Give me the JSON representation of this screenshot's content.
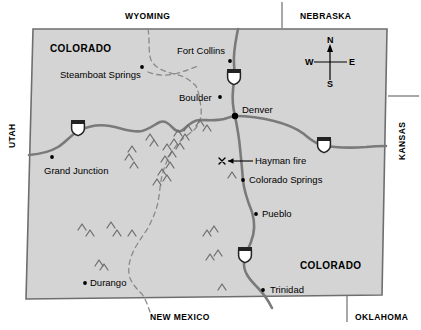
{
  "map": {
    "title": "Colorado state map showing the Hayman fire location",
    "fill_color": "#d4d4d4",
    "outline_color": "#6e6e6e",
    "road_color": "#7a7a7a",
    "border_dash_color": "#8a8a8a"
  },
  "neighbors": [
    {
      "name": "wyoming",
      "label": "WYOMING",
      "x": 125,
      "y": 12
    },
    {
      "name": "nebraska",
      "label": "NEBRASKA",
      "x": 300,
      "y": 12
    },
    {
      "name": "utah",
      "label": "UTAH",
      "x": 8,
      "y": 148,
      "rotated": "left"
    },
    {
      "name": "kansas",
      "label": "KANSAS",
      "x": 398,
      "y": 160,
      "rotated": "left"
    },
    {
      "name": "new-mexico",
      "label": "NEW MEXICO",
      "x": 150,
      "y": 313
    },
    {
      "name": "oklahoma",
      "label": "OKLAHOMA",
      "x": 355,
      "y": 313
    }
  ],
  "state_labels": [
    {
      "name": "colorado-northwest",
      "label": "COLORADO",
      "x": 50,
      "y": 44
    },
    {
      "name": "colorado-southeast",
      "label": "COLORADO",
      "x": 300,
      "y": 261
    }
  ],
  "cities": [
    {
      "name": "steamboat-springs",
      "label": "Steamboat Springs",
      "dot_x": 142,
      "dot_y": 67,
      "label_x": 60,
      "label_y": 70,
      "anchor": "left"
    },
    {
      "name": "fort-collins",
      "label": "Fort Collins",
      "dot_x": 230,
      "dot_y": 61,
      "label_x": 177,
      "label_y": 46,
      "anchor": "left"
    },
    {
      "name": "boulder",
      "label": "Boulder",
      "dot_x": 220,
      "dot_y": 97,
      "label_x": 179,
      "label_y": 93,
      "anchor": "left"
    },
    {
      "name": "denver",
      "label": "Denver",
      "dot_x": 235,
      "dot_y": 116,
      "label_x": 242,
      "label_y": 105,
      "anchor": "left"
    },
    {
      "name": "grand-junction",
      "label": "Grand Junction",
      "dot_x": 52,
      "dot_y": 157,
      "label_x": 44,
      "label_y": 166,
      "anchor": "left"
    },
    {
      "name": "colorado-springs",
      "label": "Colorado Springs",
      "dot_x": 243,
      "dot_y": 180,
      "label_x": 249,
      "label_y": 175,
      "anchor": "left"
    },
    {
      "name": "pueblo",
      "label": "Pueblo",
      "dot_x": 256,
      "dot_y": 214,
      "label_x": 262,
      "label_y": 209,
      "anchor": "left"
    },
    {
      "name": "trinidad",
      "label": "Trinidad",
      "dot_x": 263,
      "dot_y": 290,
      "label_x": 270,
      "label_y": 285,
      "anchor": "left"
    },
    {
      "name": "durango",
      "label": "Durango",
      "dot_x": 85,
      "dot_y": 283,
      "label_x": 90,
      "label_y": 278,
      "anchor": "left"
    }
  ],
  "annotations": [
    {
      "name": "hayman-fire",
      "label": "Hayman fire",
      "marker": "x",
      "marker_x": 222,
      "marker_y": 161,
      "arrow_from_x": 253,
      "arrow_to_x": 228,
      "arrow_y": 161,
      "label_x": 255,
      "label_y": 156
    }
  ],
  "highways": [
    {
      "name": "i-70-west",
      "number": "70",
      "x": 78,
      "y": 128
    },
    {
      "name": "i-70-east",
      "number": "70",
      "x": 324,
      "y": 145
    },
    {
      "name": "i-25-north",
      "number": "25",
      "x": 234,
      "y": 77
    },
    {
      "name": "i-25-south",
      "number": "25",
      "x": 245,
      "y": 255
    }
  ],
  "compass": {
    "name": "compass-rose",
    "north": "N",
    "south": "S",
    "east": "E",
    "west": "W",
    "center_x": 330,
    "center_y": 62
  }
}
